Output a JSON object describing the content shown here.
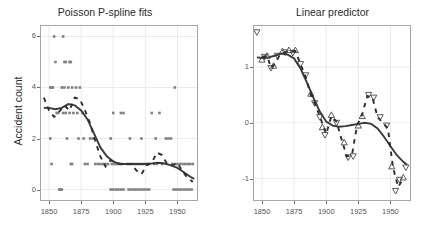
{
  "figure": {
    "background": "#ffffff",
    "panel_background": "#ffffff",
    "panel_border_color": "#a6a6a6",
    "grid_color": "#ebebeb",
    "point_color": "#808080",
    "curve_color": "#3a3a3a",
    "dash_color": "#2e2e2e",
    "marker_color": "#4a4a4a"
  },
  "chart_data": [
    {
      "type": "scatter",
      "panel": "left",
      "title": "Poisson P-spline fits",
      "xlabel": "",
      "ylabel": "Accident count",
      "xlim": [
        1843,
        1966
      ],
      "ylim": [
        -0.45,
        6.45
      ],
      "xticks": [
        1850,
        1875,
        1900,
        1925,
        1950
      ],
      "yticks": [
        0,
        2,
        4,
        6
      ],
      "grid": true,
      "legend": "none",
      "points": [
        {
          "x": 1851,
          "y": 4
        },
        {
          "x": 1852,
          "y": 4
        },
        {
          "x": 1853,
          "y": 4
        },
        {
          "x": 1851,
          "y": 2
        },
        {
          "x": 1852,
          "y": 1
        },
        {
          "x": 1854,
          "y": 6
        },
        {
          "x": 1855,
          "y": 5
        },
        {
          "x": 1856,
          "y": 3
        },
        {
          "x": 1857,
          "y": 3
        },
        {
          "x": 1858,
          "y": 0
        },
        {
          "x": 1859,
          "y": 0
        },
        {
          "x": 1860,
          "y": 0
        },
        {
          "x": 1861,
          "y": 6
        },
        {
          "x": 1862,
          "y": 5
        },
        {
          "x": 1863,
          "y": 5
        },
        {
          "x": 1860,
          "y": 4
        },
        {
          "x": 1862,
          "y": 4
        },
        {
          "x": 1861,
          "y": 3
        },
        {
          "x": 1863,
          "y": 3
        },
        {
          "x": 1864,
          "y": 2
        },
        {
          "x": 1866,
          "y": 5
        },
        {
          "x": 1867,
          "y": 5
        },
        {
          "x": 1865,
          "y": 4
        },
        {
          "x": 1868,
          "y": 4
        },
        {
          "x": 1866,
          "y": 3
        },
        {
          "x": 1869,
          "y": 3
        },
        {
          "x": 1867,
          "y": 1
        },
        {
          "x": 1868,
          "y": 1
        },
        {
          "x": 1871,
          "y": 4
        },
        {
          "x": 1874,
          "y": 4
        },
        {
          "x": 1872,
          "y": 3
        },
        {
          "x": 1876,
          "y": 3
        },
        {
          "x": 1873,
          "y": 2
        },
        {
          "x": 1877,
          "y": 2
        },
        {
          "x": 1878,
          "y": 1
        },
        {
          "x": 1880,
          "y": 1
        },
        {
          "x": 1882,
          "y": 2
        },
        {
          "x": 1884,
          "y": 2
        },
        {
          "x": 1886,
          "y": 1
        },
        {
          "x": 1888,
          "y": 1
        },
        {
          "x": 1890,
          "y": 1
        },
        {
          "x": 1892,
          "y": 1
        },
        {
          "x": 1894,
          "y": 1
        },
        {
          "x": 1896,
          "y": 1
        },
        {
          "x": 1898,
          "y": 0
        },
        {
          "x": 1900,
          "y": 0
        },
        {
          "x": 1902,
          "y": 0
        },
        {
          "x": 1904,
          "y": 0
        },
        {
          "x": 1906,
          "y": 0
        },
        {
          "x": 1908,
          "y": 0
        },
        {
          "x": 1899,
          "y": 1
        },
        {
          "x": 1901,
          "y": 1
        },
        {
          "x": 1903,
          "y": 1
        },
        {
          "x": 1905,
          "y": 1
        },
        {
          "x": 1907,
          "y": 1
        },
        {
          "x": 1900,
          "y": 3
        },
        {
          "x": 1906,
          "y": 3
        },
        {
          "x": 1908,
          "y": 3
        },
        {
          "x": 1898,
          "y": 2
        },
        {
          "x": 1912,
          "y": 0
        },
        {
          "x": 1914,
          "y": 0
        },
        {
          "x": 1916,
          "y": 0
        },
        {
          "x": 1918,
          "y": 0
        },
        {
          "x": 1920,
          "y": 0
        },
        {
          "x": 1922,
          "y": 0
        },
        {
          "x": 1924,
          "y": 0
        },
        {
          "x": 1926,
          "y": 0
        },
        {
          "x": 1928,
          "y": 0
        },
        {
          "x": 1911,
          "y": 1
        },
        {
          "x": 1913,
          "y": 1
        },
        {
          "x": 1915,
          "y": 1
        },
        {
          "x": 1917,
          "y": 1
        },
        {
          "x": 1919,
          "y": 1
        },
        {
          "x": 1921,
          "y": 1
        },
        {
          "x": 1923,
          "y": 1
        },
        {
          "x": 1925,
          "y": 1
        },
        {
          "x": 1927,
          "y": 1
        },
        {
          "x": 1913,
          "y": 2
        },
        {
          "x": 1922,
          "y": 2
        },
        {
          "x": 1930,
          "y": 3
        },
        {
          "x": 1936,
          "y": 3
        },
        {
          "x": 1932,
          "y": 1
        },
        {
          "x": 1934,
          "y": 1
        },
        {
          "x": 1938,
          "y": 1
        },
        {
          "x": 1933,
          "y": 2
        },
        {
          "x": 1941,
          "y": 2
        },
        {
          "x": 1943,
          "y": 2
        },
        {
          "x": 1945,
          "y": 2
        },
        {
          "x": 1948,
          "y": 4
        },
        {
          "x": 1946,
          "y": 1
        },
        {
          "x": 1948,
          "y": 1
        },
        {
          "x": 1950,
          "y": 1
        },
        {
          "x": 1952,
          "y": 1
        },
        {
          "x": 1954,
          "y": 1
        },
        {
          "x": 1956,
          "y": 1
        },
        {
          "x": 1958,
          "y": 1
        },
        {
          "x": 1960,
          "y": 1
        },
        {
          "x": 1962,
          "y": 1
        },
        {
          "x": 1947,
          "y": 0
        },
        {
          "x": 1949,
          "y": 0
        },
        {
          "x": 1951,
          "y": 0
        },
        {
          "x": 1953,
          "y": 0
        },
        {
          "x": 1955,
          "y": 0
        },
        {
          "x": 1957,
          "y": 0
        },
        {
          "x": 1959,
          "y": 0
        },
        {
          "x": 1961,
          "y": 0
        }
      ],
      "series": [
        {
          "name": "fitted mean",
          "style": "solid",
          "x": [
            1846,
            1850,
            1855,
            1860,
            1865,
            1870,
            1875,
            1880,
            1885,
            1890,
            1895,
            1900,
            1905,
            1910,
            1915,
            1920,
            1925,
            1930,
            1935,
            1940,
            1945,
            1950,
            1955,
            1960,
            1963
          ],
          "values": [
            3.2,
            3.2,
            3.15,
            3.2,
            3.35,
            3.3,
            3.1,
            2.75,
            2.2,
            1.65,
            1.3,
            1.1,
            1.0,
            1.0,
            1.0,
            1.0,
            1.0,
            1.02,
            1.05,
            1.02,
            0.95,
            0.85,
            0.68,
            0.5,
            0.42
          ]
        },
        {
          "name": "dashed fit",
          "style": "dashed",
          "x": [
            1846,
            1850,
            1854,
            1858,
            1862,
            1866,
            1870,
            1874,
            1878,
            1882,
            1886,
            1890,
            1894,
            1898,
            1902,
            1906,
            1910,
            1914,
            1918,
            1922,
            1926,
            1930,
            1934,
            1938,
            1942,
            1946,
            1950,
            1954,
            1958,
            1962
          ],
          "values": [
            3.6,
            3.1,
            2.85,
            3.05,
            3.3,
            3.1,
            3.6,
            3.55,
            3.1,
            2.6,
            1.9,
            1.3,
            0.9,
            1.15,
            1.05,
            1.0,
            1.0,
            1.0,
            0.75,
            0.6,
            0.95,
            1.05,
            1.45,
            1.35,
            1.0,
            0.95,
            1.05,
            0.7,
            0.45,
            0.3
          ]
        }
      ]
    },
    {
      "type": "scatter",
      "panel": "right",
      "title": "Linear predictor",
      "xlabel": "",
      "ylabel": "",
      "xlim": [
        1843,
        1966
      ],
      "ylim": [
        -1.4,
        1.75
      ],
      "xticks": [
        1850,
        1875,
        1900,
        1925,
        1950
      ],
      "yticks": [
        1,
        0,
        -1
      ],
      "grid": true,
      "legend": "none",
      "markers": [
        {
          "x": 1846,
          "y": 1.62,
          "shape": "triangle-down"
        },
        {
          "x": 1850,
          "y": 1.13,
          "shape": "triangle-up"
        },
        {
          "x": 1852,
          "y": 1.18,
          "shape": "triangle-down"
        },
        {
          "x": 1854,
          "y": 1.2,
          "shape": "triangle-up"
        },
        {
          "x": 1857,
          "y": 0.98,
          "shape": "triangle-down"
        },
        {
          "x": 1859,
          "y": 1.02,
          "shape": "triangle-up"
        },
        {
          "x": 1862,
          "y": 1.2,
          "shape": "triangle-down"
        },
        {
          "x": 1866,
          "y": 1.28,
          "shape": "triangle-up"
        },
        {
          "x": 1868,
          "y": 1.26,
          "shape": "triangle-down"
        },
        {
          "x": 1871,
          "y": 1.3,
          "shape": "triangle-up"
        },
        {
          "x": 1874,
          "y": 1.25,
          "shape": "triangle-down"
        },
        {
          "x": 1876,
          "y": 1.3,
          "shape": "triangle-up"
        },
        {
          "x": 1880,
          "y": 1.05,
          "shape": "triangle-down"
        },
        {
          "x": 1884,
          "y": 0.85,
          "shape": "triangle-down"
        },
        {
          "x": 1888,
          "y": 0.52,
          "shape": "triangle-up"
        },
        {
          "x": 1891,
          "y": 0.35,
          "shape": "triangle-down"
        },
        {
          "x": 1895,
          "y": 0.1,
          "shape": "triangle-down"
        },
        {
          "x": 1897,
          "y": -0.08,
          "shape": "triangle-up"
        },
        {
          "x": 1899,
          "y": -0.22,
          "shape": "triangle-down"
        },
        {
          "x": 1904,
          "y": 0.14,
          "shape": "triangle-up"
        },
        {
          "x": 1908,
          "y": 0.0,
          "shape": "triangle-down"
        },
        {
          "x": 1914,
          "y": -0.35,
          "shape": "triangle-up"
        },
        {
          "x": 1917,
          "y": -0.62,
          "shape": "triangle-down"
        },
        {
          "x": 1921,
          "y": -0.6,
          "shape": "triangle-down"
        },
        {
          "x": 1925,
          "y": -0.05,
          "shape": "triangle-up"
        },
        {
          "x": 1928,
          "y": 0.12,
          "shape": "triangle-up"
        },
        {
          "x": 1933,
          "y": 0.5,
          "shape": "triangle-down"
        },
        {
          "x": 1937,
          "y": 0.45,
          "shape": "triangle-down"
        },
        {
          "x": 1942,
          "y": 0.1,
          "shape": "triangle-down"
        },
        {
          "x": 1947,
          "y": -0.05,
          "shape": "triangle-down"
        },
        {
          "x": 1951,
          "y": -0.78,
          "shape": "triangle-up"
        },
        {
          "x": 1954,
          "y": -1.22,
          "shape": "triangle-down"
        },
        {
          "x": 1957,
          "y": -1.02,
          "shape": "triangle-down"
        },
        {
          "x": 1960,
          "y": -0.98,
          "shape": "triangle-up"
        },
        {
          "x": 1962,
          "y": -0.8,
          "shape": "triangle-down"
        }
      ],
      "series": [
        {
          "name": "linear predictor",
          "style": "solid",
          "x": [
            1846,
            1850,
            1855,
            1860,
            1865,
            1870,
            1875,
            1880,
            1885,
            1890,
            1895,
            1900,
            1905,
            1910,
            1915,
            1920,
            1925,
            1930,
            1935,
            1940,
            1945,
            1950,
            1955,
            1960,
            1963
          ],
          "values": [
            1.17,
            1.16,
            1.17,
            1.2,
            1.24,
            1.22,
            1.15,
            0.97,
            0.72,
            0.45,
            0.2,
            0.02,
            -0.05,
            -0.07,
            -0.06,
            -0.04,
            -0.02,
            0.0,
            -0.02,
            -0.1,
            -0.25,
            -0.42,
            -0.58,
            -0.7,
            -0.75
          ]
        },
        {
          "name": "dashed segments",
          "style": "dashed",
          "x": [
            1850,
            1854,
            1857,
            1860,
            1864,
            1868,
            1872,
            1876,
            1880,
            1884,
            1888,
            1892,
            1896,
            1900,
            1904,
            1908,
            1912,
            1916,
            1920,
            1924,
            1928,
            1932,
            1936,
            1940,
            1944,
            1948,
            1952,
            1956,
            1960
          ],
          "values": [
            1.18,
            1.2,
            0.98,
            1.05,
            1.22,
            1.26,
            1.3,
            1.28,
            1.05,
            0.82,
            0.5,
            0.3,
            0.05,
            -0.2,
            0.12,
            0.02,
            -0.3,
            -0.6,
            -0.58,
            -0.05,
            0.15,
            0.48,
            0.45,
            0.1,
            0.0,
            -0.1,
            -0.8,
            -1.15,
            -1.0
          ]
        }
      ]
    }
  ]
}
